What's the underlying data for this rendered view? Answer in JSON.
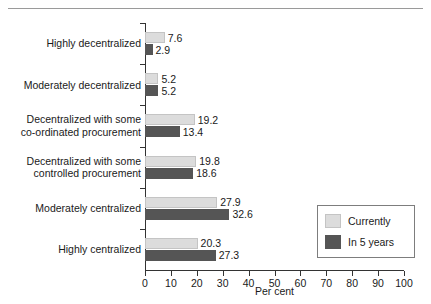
{
  "chart_data": {
    "type": "bar",
    "orientation": "horizontal",
    "title": "",
    "subtitle": "",
    "xlabel": "Per cent",
    "ylabel": "",
    "xlim": [
      0,
      100
    ],
    "xticks": [
      0,
      10,
      20,
      30,
      40,
      50,
      60,
      70,
      80,
      90,
      100
    ],
    "grid": false,
    "legend_position": "lower-right",
    "categories": [
      "Highly decentralized",
      "Moderately decentralized",
      "Decentralized with some\nco-ordinated procurement",
      "Decentralized with some\ncontrolled procurement",
      "Moderately centralized",
      "Highly centralized"
    ],
    "series": [
      {
        "name": "Currently",
        "color": "#dcdcdc",
        "values": [
          7.6,
          5.2,
          19.2,
          19.8,
          27.9,
          20.3
        ],
        "labels": [
          "7.6",
          "5.2",
          "19.2",
          "19.8",
          "27.9",
          "20.3"
        ]
      },
      {
        "name": "In 5 years",
        "color": "#555555",
        "values": [
          2.9,
          5.2,
          13.4,
          18.6,
          32.6,
          27.3
        ],
        "labels": [
          "2.9",
          "5.2",
          "13.4",
          "18.6",
          "32.6",
          "27.3"
        ]
      }
    ]
  },
  "axis": {
    "x_tick_labels": [
      "0",
      "10",
      "20",
      "30",
      "40",
      "50",
      "60",
      "70",
      "80",
      "90",
      "100"
    ],
    "x_title": "Per cent"
  },
  "legend": {
    "entries": [
      {
        "label": "Currently",
        "color": "#dcdcdc"
      },
      {
        "label": "In 5 years",
        "color": "#555555"
      }
    ]
  }
}
